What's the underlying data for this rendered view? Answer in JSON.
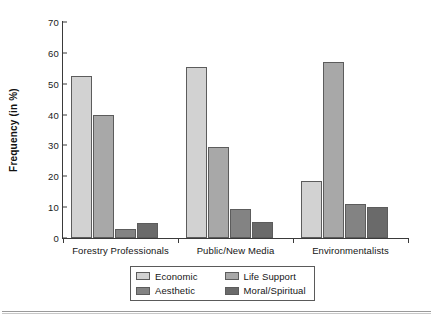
{
  "chart_data": {
    "type": "bar",
    "title": "",
    "xlabel": "",
    "ylabel": "Frequency (in %)",
    "ylim": [
      0,
      70
    ],
    "yticks": [
      0,
      10,
      20,
      30,
      40,
      50,
      60,
      70
    ],
    "grid": false,
    "legend_position": "bottom-center",
    "categories": [
      "Forestry Professionals",
      "Public/New Media",
      "Environmentalists"
    ],
    "series": [
      {
        "name": "Economic",
        "color": "#d2d2d2",
        "values": [
          52.6,
          55.5,
          18.4
        ]
      },
      {
        "name": "Life Support",
        "color": "#a8a8a8",
        "values": [
          39.9,
          29.5,
          57.2
        ]
      },
      {
        "name": "Aesthetic",
        "color": "#838383",
        "values": [
          3.0,
          9.3,
          11.0
        ]
      },
      {
        "name": "Moral/Spiritual",
        "color": "#6a6a6a",
        "values": [
          4.9,
          5.3,
          10.2
        ]
      }
    ],
    "draw_order": [
      "Economic",
      "Life Support",
      "Aesthetic",
      "Moral/Spiritual"
    ]
  },
  "axis": {
    "y_title": "Frequency (in %)",
    "y_ticks": [
      "0",
      "10",
      "20",
      "30",
      "40",
      "50",
      "60",
      "70"
    ]
  },
  "legend": {
    "items": [
      {
        "label": "Economic",
        "swatch": "#d2d2d2"
      },
      {
        "label": "Life Support",
        "swatch": "#a8a8a8"
      },
      {
        "label": "Aesthetic",
        "swatch": "#838383"
      },
      {
        "label": "Moral/Spiritual",
        "swatch": "#6a6a6a"
      }
    ]
  },
  "categories": [
    {
      "label": "Forestry Professionals"
    },
    {
      "label": "Public/New Media"
    },
    {
      "label": "Environmentalists"
    }
  ]
}
